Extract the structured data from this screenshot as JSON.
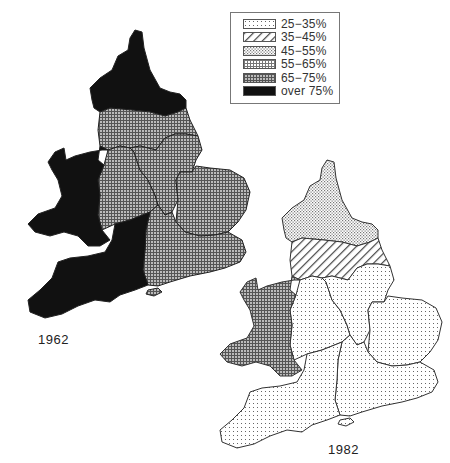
{
  "legend": {
    "items": [
      {
        "label": "25−35%",
        "pattern": "p25"
      },
      {
        "label": "35−45%",
        "pattern": "p35"
      },
      {
        "label": "45−55%",
        "pattern": "p45"
      },
      {
        "label": "55−65%",
        "pattern": "p55"
      },
      {
        "label": "65−75%",
        "pattern": "p65"
      },
      {
        "label": "over 75%",
        "pattern": "p75"
      }
    ]
  },
  "maps": [
    {
      "year": "1962",
      "regions": {
        "north": "over 75%",
        "yorkshire_humberside": "65−75%",
        "north_west": "65−75%",
        "west_midlands": "65−75%",
        "east_midlands": "65−75%",
        "east_anglia": "65−75%",
        "south_east": "65−75%",
        "south_west": "over 75%",
        "wales": "over 75%"
      }
    },
    {
      "year": "1982",
      "regions": {
        "north": "45−55%",
        "yorkshire_humberside": "35−45%",
        "west_midlands": "25−35%",
        "east_midlands": "25−35%",
        "east_anglia": "25−35%",
        "south_east": "25−35%",
        "south_west": "25−35%",
        "wales": "65−75%"
      }
    }
  ],
  "colors": {
    "black": "#111111",
    "outline": "#333333"
  }
}
